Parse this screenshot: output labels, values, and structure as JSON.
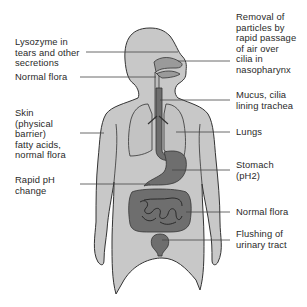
{
  "diagram": {
    "colors": {
      "body_fill": "#c8c8c8",
      "organ_fill": "#6e6e6e",
      "outline": "#333333",
      "leader_line": "#444444",
      "text": "#2a2a2a"
    },
    "labels_left": [
      {
        "text": "Lysozyme in\ntears and other\nsecretions",
        "target": "eye"
      },
      {
        "text": "Normal flora",
        "target": "mouth"
      },
      {
        "text": "Skin\n(physical\nbarrier)\nfatty acids,\nnormal flora",
        "target": "skin"
      },
      {
        "text": "Rapid pH\nchange",
        "target": "duodenum"
      }
    ],
    "labels_right": [
      {
        "text": "Removal of\nparticles by\nrapid passage\nof air over\ncilia in\nnasopharynx",
        "target": "nasopharynx"
      },
      {
        "text": "Mucus, cilia\nlining trachea",
        "target": "trachea"
      },
      {
        "text": "Lungs",
        "target": "lungs"
      },
      {
        "text": "Stomach\n(pH2)",
        "target": "stomach"
      },
      {
        "text": "Normal flora",
        "target": "intestines"
      },
      {
        "text": "Flushing of\nurinary tract",
        "target": "bladder"
      }
    ]
  }
}
